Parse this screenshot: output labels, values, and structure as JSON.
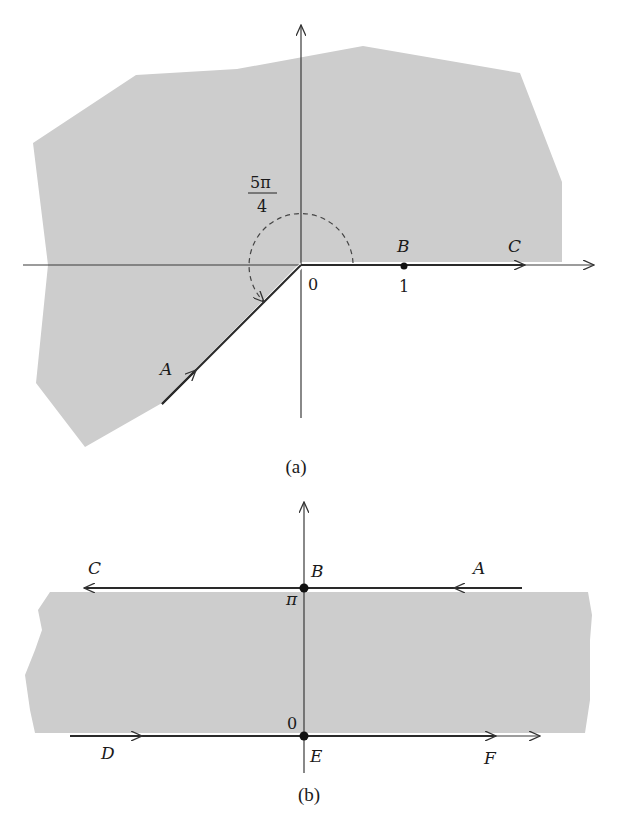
{
  "figure_a": {
    "caption": "(a)",
    "angle_label_numerator": "5π",
    "angle_label_denominator": "4",
    "origin_label": "0",
    "tick_label_1": "1",
    "point_labels": {
      "A": "A",
      "B": "B",
      "C": "C"
    },
    "description": "Shaded region in complex plane with cut along positive real axis from 0 and along ray at angle 5π/4; contour from A along ray into origin then out along real axis through B=1 to C"
  },
  "figure_b": {
    "caption": "(b)",
    "top_line_label": "π",
    "bottom_line_label": "0",
    "point_labels": {
      "A": "A",
      "B": "B",
      "C": "C",
      "D": "D",
      "E": "E",
      "F": "F"
    },
    "description": "Horizontal strip 0 < Im < π shaded; top line traversed A→B→C (right to left), bottom line D→E→F (left to right)"
  },
  "colors": {
    "shade": "#cdcdcd",
    "line": "#2a2a2a",
    "background": "#ffffff"
  }
}
